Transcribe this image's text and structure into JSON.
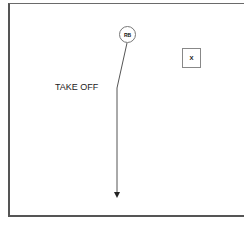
{
  "diagram": {
    "type": "football-play",
    "play_name": "TAKE OFF",
    "players": [
      {
        "label": "RB",
        "shape": "circle",
        "role": "offense"
      },
      {
        "label": "X",
        "shape": "square",
        "role": "receiver"
      }
    ],
    "routes": [
      {
        "player": "RB",
        "description": "slant then straight downfield",
        "end": "arrow"
      }
    ],
    "colors": {
      "line": "#555555",
      "background": "#ffffff",
      "text": "#222222"
    }
  }
}
